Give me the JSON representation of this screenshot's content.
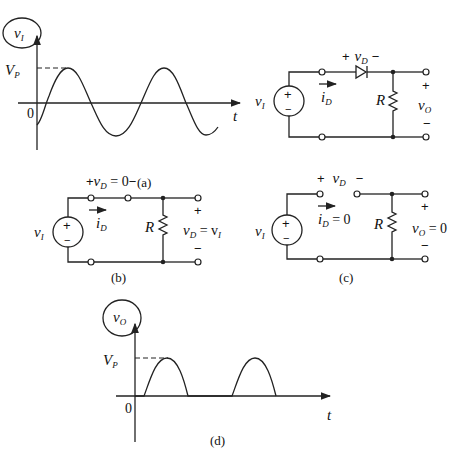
{
  "figure": {
    "panel_a_graph": {
      "caption": "(a)",
      "y_label": "v",
      "y_label_sub": "I",
      "peak_label": "V",
      "peak_label_sub": "P",
      "origin_label": "0",
      "x_label": "t"
    },
    "panel_a_circuit": {
      "source_label": "v",
      "source_label_sub": "I",
      "source_plus": "+",
      "source_minus": "−",
      "diode_voltage_plus": "+",
      "diode_voltage": "v",
      "diode_voltage_sub": "D",
      "diode_voltage_minus": "−",
      "current_label": "i",
      "current_label_sub": "D",
      "resistor_label": "R",
      "output_plus": "+",
      "output_label": "v",
      "output_label_sub": "O",
      "output_minus": "−"
    },
    "panel_b": {
      "caption": "(b)",
      "source_label": "v",
      "source_label_sub": "I",
      "diode_voltage_text_plus": "+",
      "diode_voltage": "v",
      "diode_voltage_sub": "D",
      "diode_voltage_eq": " = 0",
      "diode_voltage_text_minus": "−",
      "current_label": "i",
      "current_label_sub": "D",
      "resistor_label": "R",
      "output_plus": "+",
      "output_label": "v",
      "output_label_sub": "D",
      "output_eq": " = v",
      "output_eq_sub": "I",
      "output_minus": "−"
    },
    "panel_c": {
      "caption": "(c)",
      "source_label": "v",
      "source_label_sub": "I",
      "diode_voltage_plus": "+",
      "diode_voltage": "v",
      "diode_voltage_sub": "D",
      "diode_voltage_minus": "−",
      "current_label": "i",
      "current_label_sub": "D",
      "current_eq": " = 0",
      "resistor_label": "R",
      "output_plus": "+",
      "output_label": "v",
      "output_label_sub": "O",
      "output_eq": " = 0",
      "output_minus": "−"
    },
    "panel_d_graph": {
      "caption": "(d)",
      "y_label": "v",
      "y_label_sub": "O",
      "peak_label": "V",
      "peak_label_sub": "P",
      "origin_label": "0",
      "x_label": "t"
    }
  }
}
